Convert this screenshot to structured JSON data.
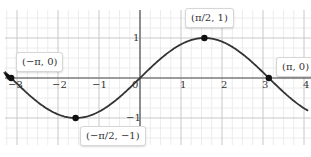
{
  "chart_data": {
    "type": "line",
    "title": "",
    "xlabel": "",
    "ylabel": "",
    "function": "y = sin(x)",
    "xlim": [
      -3.3,
      4.1
    ],
    "ylim": [
      -1.6,
      1.7
    ],
    "grid": true,
    "minor_grid_step": 0.25,
    "x_ticks": [
      -3,
      -2,
      -1,
      0,
      1,
      2,
      3,
      4
    ],
    "x_tick_labels": [
      "−3",
      "−2",
      "−1",
      "0",
      "1",
      "2",
      "3",
      "4"
    ],
    "y_ticks": [
      1,
      -1
    ],
    "y_tick_labels": [
      "1",
      "−1"
    ],
    "series": [
      {
        "name": "sin(x)",
        "color": "#333333",
        "x": [
          -3.3,
          -3.14159,
          -2.5,
          -2.0,
          -1.5708,
          -1.0,
          -0.5,
          0,
          0.5,
          1.0,
          1.5708,
          2.0,
          2.5,
          3.14159,
          3.5,
          4.0
        ],
        "y": [
          0.158,
          0,
          -0.598,
          -0.909,
          -1,
          -0.841,
          -0.479,
          0,
          0.479,
          0.841,
          1,
          0.909,
          0.598,
          0,
          -0.351,
          -0.757
        ]
      }
    ],
    "points": [
      {
        "x": -3.14159,
        "y": 0,
        "label": "(−π, 0)"
      },
      {
        "x": -1.5708,
        "y": -1,
        "label": "(−π/2, −1)"
      },
      {
        "x": 1.5708,
        "y": 1,
        "label": "(π/2, 1)"
      },
      {
        "x": 3.14159,
        "y": 0,
        "label": "(π, 0)"
      }
    ],
    "legend": null
  },
  "labels": {
    "neg_pi": "(−π, 0)",
    "neg_half_pi": "(−π/2, −1)",
    "half_pi": "(π/2, 1)",
    "pi": "(π, 0)"
  },
  "ticks": {
    "xm3": "−3",
    "xm2": "−2",
    "xm1": "−1",
    "x0": "0",
    "x1": "1",
    "x2": "2",
    "x3": "3",
    "x4": "4",
    "y1": "1",
    "ym1": "−1"
  },
  "colors": {
    "curve": "#333333",
    "axis": "#555555",
    "major_grid": "#c8c8c8",
    "minor_grid": "#ececec",
    "point": "#111111"
  }
}
